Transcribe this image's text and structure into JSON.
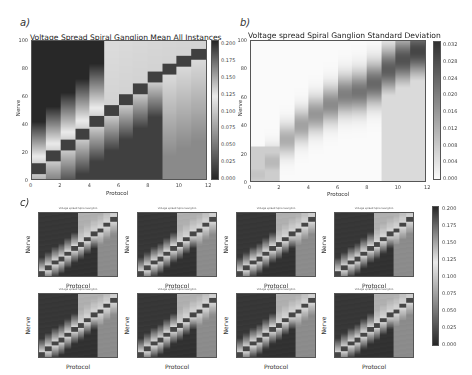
{
  "figure": {
    "panel_a": {
      "label": "a)",
      "title": "Voltage Spread Spiral Ganglion Mean All Instances",
      "xlabel": "Protocol",
      "ylabel": "Nerve",
      "xticks": [
        "0",
        "2",
        "4",
        "6",
        "8",
        "10",
        "12"
      ],
      "yticks": [
        "0",
        "20",
        "40",
        "60",
        "80",
        "100"
      ],
      "colorbar_ticks": [
        "0.200",
        "0.175",
        "0.150",
        "0.125",
        "0.100",
        "0.075",
        "0.050",
        "0.025",
        "0.000"
      ]
    },
    "panel_b": {
      "label": "b)",
      "title": "Voltage spread Spiral Ganglion Standard Deviation",
      "xlabel": "Protocol",
      "ylabel": "Nerve",
      "xticks": [
        "0",
        "2",
        "4",
        "6",
        "8",
        "10",
        "12"
      ],
      "yticks": [
        "0",
        "20",
        "40",
        "60",
        "80",
        "100"
      ],
      "colorbar_ticks": [
        "0.032",
        "0.028",
        "0.024",
        "0.020",
        "0.016",
        "0.012",
        "0.008",
        "0.004",
        "0.000"
      ]
    },
    "panel_c": {
      "label": "c)",
      "subplot_title": "Voltage spread Spiral Ganglion",
      "xlabel": "Protocol",
      "ylabel": "Nerve",
      "count": 8,
      "colorbar_ticks": [
        "0.200",
        "0.175",
        "0.150",
        "0.125",
        "0.100",
        "0.075",
        "0.050",
        "0.025",
        "0.000"
      ]
    }
  },
  "chart_data": [
    {
      "type": "heatmap",
      "title": "Voltage Spread Spiral Ganglion Mean All Instances",
      "xlabel": "Protocol",
      "ylabel": "Nerve",
      "xlim": [
        0,
        12
      ],
      "ylim": [
        0,
        100
      ],
      "colorbar_range": [
        0.0,
        0.2
      ],
      "colormap": "gray (dark = high)",
      "columns": 12,
      "band_centers_nerve": [
        8,
        17,
        25,
        33,
        42,
        50,
        58,
        66,
        74,
        80,
        86,
        91
      ],
      "description": "Each protocol column shows a dark band (high voltage ~0.2) at a nerve position increasing diagonally from ~8 at protocol 0 to ~91 at protocol 11; upper-left region dark, lower-right darker, light region between"
    },
    {
      "type": "heatmap",
      "title": "Voltage spread Spiral Ganglion Standard Deviation",
      "xlabel": "Protocol",
      "ylabel": "Nerve",
      "xlim": [
        0,
        12
      ],
      "ylim": [
        0,
        100
      ],
      "colorbar_range": [
        0.0,
        0.034
      ],
      "colormap": "gray_r (dark = high)",
      "columns": 12,
      "band_centers_nerve": [
        5,
        14,
        30,
        40,
        48,
        55,
        62,
        64,
        70,
        80,
        87,
        93
      ],
      "description": "Mostly white background with darker diagonal band of standard deviation peaking ~0.032 near top-right"
    },
    {
      "type": "heatmap",
      "title": "Voltage spread Spiral Ganglion (8 instances)",
      "grid": [
        2,
        4
      ],
      "xlabel": "Protocol",
      "ylabel": "Nerve",
      "colorbar_range": [
        0.0,
        0.2
      ],
      "description": "Eight individual instance heatmaps each showing a diagonal band of dark cells from lower-left to upper-right"
    }
  ]
}
